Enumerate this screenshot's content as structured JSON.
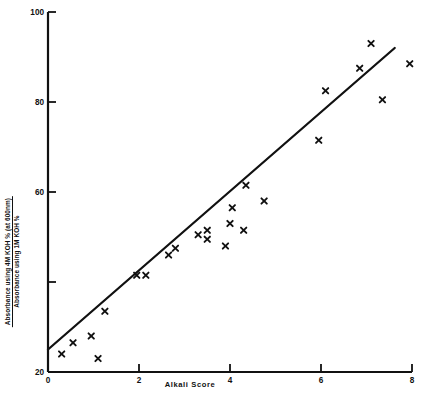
{
  "chart_data": {
    "type": "scatter",
    "title": "",
    "xlabel": "Alkali Score",
    "ylabel_numerator": "Absorbance using  4M KOH  % (at 600nm)",
    "ylabel_denominator": "Absorbance using  1M KOH  %",
    "xlim": [
      0,
      8
    ],
    "ylim": [
      20,
      100
    ],
    "xticks": [
      0,
      2,
      4,
      6,
      8
    ],
    "xticklabels": [
      "0",
      "2",
      "4",
      "6",
      "8"
    ],
    "yticks": [
      20,
      40,
      60,
      80,
      100
    ],
    "yticklabels": [
      "20",
      "",
      "60",
      "80",
      "100"
    ],
    "grid": false,
    "legend": null,
    "marker": "x",
    "points": [
      {
        "x": 0.3,
        "y": 24.0
      },
      {
        "x": 0.55,
        "y": 26.5
      },
      {
        "x": 0.95,
        "y": 28.0
      },
      {
        "x": 1.1,
        "y": 23.0
      },
      {
        "x": 1.25,
        "y": 33.5
      },
      {
        "x": 1.95,
        "y": 41.5
      },
      {
        "x": 2.15,
        "y": 41.5
      },
      {
        "x": 2.65,
        "y": 46.0
      },
      {
        "x": 2.8,
        "y": 47.5
      },
      {
        "x": 3.3,
        "y": 50.5
      },
      {
        "x": 3.5,
        "y": 51.5
      },
      {
        "x": 3.5,
        "y": 49.5
      },
      {
        "x": 3.9,
        "y": 48.0
      },
      {
        "x": 4.0,
        "y": 53.0
      },
      {
        "x": 4.05,
        "y": 56.5
      },
      {
        "x": 4.3,
        "y": 51.5
      },
      {
        "x": 4.35,
        "y": 61.5
      },
      {
        "x": 4.75,
        "y": 58.0
      },
      {
        "x": 5.95,
        "y": 71.5
      },
      {
        "x": 6.1,
        "y": 82.5
      },
      {
        "x": 6.85,
        "y": 87.5
      },
      {
        "x": 7.1,
        "y": 93.0
      },
      {
        "x": 7.35,
        "y": 80.5
      },
      {
        "x": 7.95,
        "y": 88.5
      }
    ],
    "fit_line": {
      "x0": 0.0,
      "y0": 25.0,
      "x1": 7.62,
      "y1": 92.0
    }
  }
}
